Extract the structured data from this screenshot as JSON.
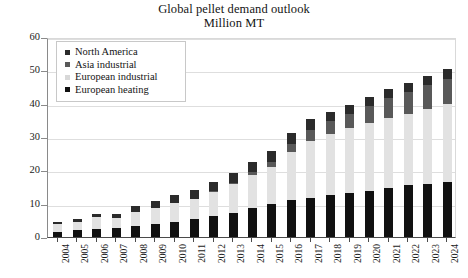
{
  "chart_data": {
    "type": "bar",
    "stacked": true,
    "title": "Global pellet demand outlook",
    "subtitle": "Million MT",
    "xlabel": "",
    "ylabel": "",
    "ylim": [
      0,
      60
    ],
    "yticks": [
      0,
      10,
      20,
      30,
      40,
      50,
      60
    ],
    "grid": true,
    "legend_position": "top-left",
    "categories": [
      "2004",
      "2005",
      "2006",
      "2007",
      "2008",
      "2009",
      "2010",
      "2011",
      "2012",
      "2013",
      "2014",
      "2015",
      "2016",
      "2017",
      "2018",
      "2019",
      "2020",
      "2021",
      "2022",
      "2023",
      "2024"
    ],
    "series": [
      {
        "name": "European heating",
        "color": "#111111",
        "values": [
          1.5,
          2.0,
          2.3,
          2.6,
          3.2,
          3.8,
          4.6,
          5.4,
          6.3,
          7.3,
          8.6,
          10.0,
          11.0,
          11.8,
          12.5,
          13.2,
          13.8,
          14.8,
          15.5,
          16.0,
          16.5
        ]
      },
      {
        "name": "European industrial",
        "color": "#e2e2e2",
        "values": [
          2.5,
          2.5,
          3.6,
          3.0,
          4.3,
          5.0,
          5.6,
          6.0,
          7.2,
          8.5,
          10.0,
          11.0,
          14.5,
          17.0,
          18.5,
          19.5,
          20.5,
          21.0,
          21.5,
          22.5,
          23.5
        ]
      },
      {
        "name": "Asia industrial",
        "color": "#595959",
        "values": [
          0.0,
          0.0,
          0.0,
          0.0,
          0.0,
          0.0,
          0.0,
          0.0,
          0.2,
          0.4,
          0.8,
          1.5,
          2.5,
          3.2,
          3.8,
          4.3,
          5.0,
          5.8,
          6.5,
          7.0,
          7.5
        ]
      },
      {
        "name": "North America",
        "color": "#2b2b2b",
        "values": [
          0.5,
          0.8,
          1.1,
          1.4,
          1.8,
          2.0,
          2.3,
          2.6,
          2.8,
          3.0,
          3.1,
          3.2,
          3.3,
          3.5,
          2.8,
          2.6,
          2.6,
          2.7,
          2.8,
          2.9,
          3.0
        ]
      }
    ],
    "totals": [
      4.5,
      5.3,
      7.0,
      7.0,
      9.3,
      10.8,
      12.5,
      14.0,
      16.5,
      19.2,
      22.5,
      25.7,
      31.3,
      35.5,
      37.6,
      39.6,
      41.9,
      44.3,
      46.3,
      48.4,
      50.5
    ]
  },
  "legend": {
    "items": [
      {
        "label": "North America",
        "color": "#2b2b2b"
      },
      {
        "label": "Asia industrial",
        "color": "#595959"
      },
      {
        "label": "European industrial",
        "color": "#d8d8d8"
      },
      {
        "label": "European heating",
        "color": "#111111"
      }
    ]
  }
}
